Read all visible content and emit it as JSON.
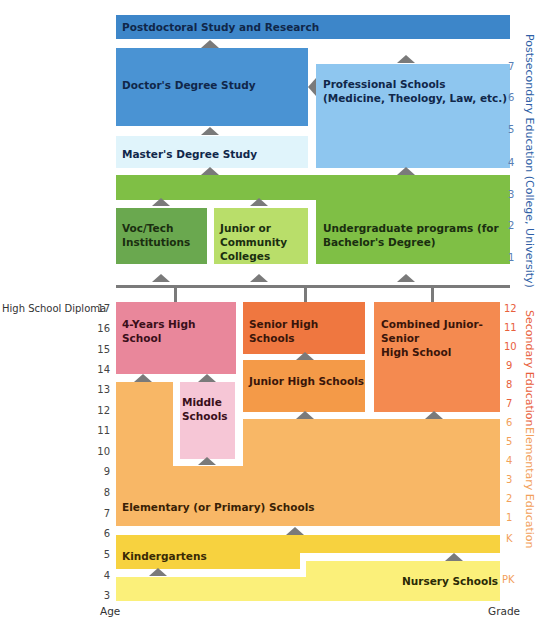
{
  "colors": {
    "postdoc": "#3d86c9",
    "doctor": "#4a93d3",
    "professional": "#8ec6ef",
    "masters": "#e0f4fb",
    "undergrad_band": "#7fbf45",
    "voc_tech": "#6aa84f",
    "junior_college": "#b9de6a",
    "four_year_hs": "#e9879b",
    "middle_schools": "#f6c6d6",
    "senior_hs": "#ef7740",
    "junior_hs": "#f49a48",
    "combined_hs": "#f48a50",
    "elementary": "#f8b766",
    "kindergarten": "#f7d23f",
    "nursery": "#fbf07a",
    "arrow": "#7a7a7a",
    "postsecondary_axis": "#2f5fa6",
    "secondary_axis": "#e8603c",
    "elementary_axis": "#f2a05a"
  },
  "blocks": {
    "postdoc": "Postdoctoral Study and Research",
    "doctor": "Doctor's Degree Study",
    "professional": "Professional Schools\n(Medicine, Theology, Law, etc.)",
    "masters": "Master's Degree Study",
    "voc_tech": "Voc/Tech\nInstitutions",
    "junior_college": "Junior or\nCommunity\nColleges",
    "undergrad": "Undergraduate programs (for\nBachelor's Degree)",
    "four_year_hs": "4-Years High School",
    "senior_hs": "Senior High Schools",
    "combined_hs": "Combined Junior-Senior\nHigh School",
    "junior_hs": "Junior High Schools",
    "middle_schools": "Middle\nSchools",
    "elementary": "Elementary (or Primary) Schools",
    "kindergarten": "Kindergartens",
    "nursery": "Nursery Schools"
  },
  "left_axis": {
    "title": "Age",
    "diploma_label": "High School Diploma",
    "ticks": [
      "17",
      "16",
      "15",
      "14",
      "13",
      "12",
      "11",
      "10",
      "9",
      "8",
      "7",
      "6",
      "5",
      "4",
      "3"
    ]
  },
  "right_axis": {
    "title": "Grade",
    "postsecondary_ticks": [
      "7",
      "6",
      "5",
      "4",
      "3",
      "2",
      "1"
    ],
    "secondary_ticks": [
      "12",
      "11",
      "10",
      "9",
      "8",
      "7"
    ],
    "elementary_ticks": [
      "6",
      "5",
      "4",
      "3",
      "2",
      "1",
      "K"
    ],
    "prek_tick": "PK",
    "postsecondary_label": "Postsecondary Education (College, University)",
    "secondary_label": "Secondary Education",
    "elementary_label": "Elementary Education"
  }
}
